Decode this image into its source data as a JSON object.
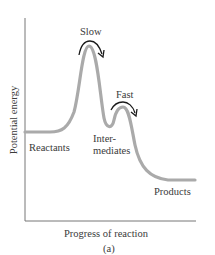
{
  "diagram": {
    "type": "reaction-energy-profile",
    "y_axis_label": "Potential energy",
    "x_axis_label": "Progress of reaction",
    "caption": "(a)",
    "states": [
      {
        "label": "Reactants"
      },
      {
        "label_line1": "Inter-",
        "label_line2": "mediates"
      },
      {
        "label": "Products"
      }
    ],
    "steps": [
      {
        "label": "Slow"
      },
      {
        "label": "Fast"
      }
    ],
    "colors": {
      "curve": "#a8a8a8",
      "axis": "#555555",
      "arrow": "#1a1a1a",
      "text": "#3a3a3a"
    }
  }
}
